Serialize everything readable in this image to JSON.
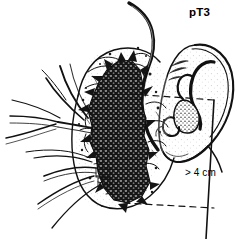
{
  "figure": {
    "title_label": "pT3",
    "measure_label": "> 4 cm",
    "colors": {
      "ink": "#111111",
      "background": "#ffffff",
      "tumor_fill": "#1a1a1a",
      "stipple": "#2b2b2b"
    },
    "annotations": {
      "stage": "pT3",
      "size": "> 4 cm"
    },
    "parts": [
      {
        "name": "ear-auricle",
        "label": "ear"
      },
      {
        "name": "helix",
        "label": "helix"
      },
      {
        "name": "antihelix",
        "label": "antihelix"
      },
      {
        "name": "concha",
        "label": "concha"
      },
      {
        "name": "tragus",
        "label": "tragus"
      },
      {
        "name": "earlobe",
        "label": "lobule"
      },
      {
        "name": "parotid-gland",
        "label": "parotid gland"
      },
      {
        "name": "tumor-mass",
        "label": "tumour"
      },
      {
        "name": "parotid-duct",
        "label": "duct"
      },
      {
        "name": "facial-nerve-branches",
        "label": "facial nerve branches"
      },
      {
        "name": "measurement-bracket",
        "label": "measurement bracket"
      },
      {
        "name": "dashed-guide-upper",
        "label": "upper dashed guide"
      },
      {
        "name": "dashed-guide-lower",
        "label": "lower dashed guide"
      }
    ]
  }
}
